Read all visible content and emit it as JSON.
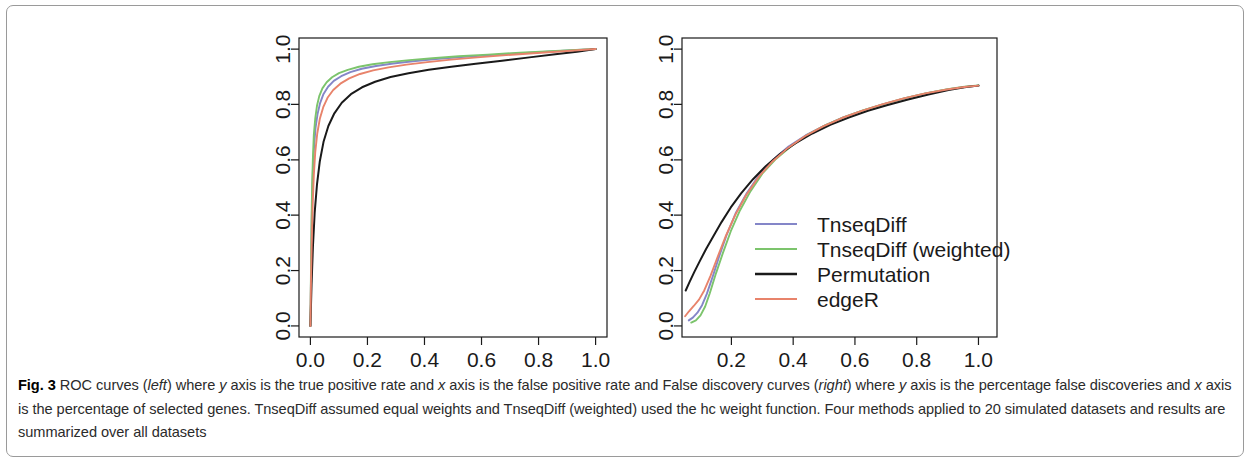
{
  "figure": {
    "label": "Fig. 3",
    "caption_parts": [
      {
        "t": " ROC curves ("
      },
      {
        "t": "left",
        "style": "italic"
      },
      {
        "t": ") where "
      },
      {
        "t": "y",
        "style": "italic"
      },
      {
        "t": " axis is the true positive rate and "
      },
      {
        "t": "x",
        "style": "italic"
      },
      {
        "t": " axis is the false positive rate and False discovery curves ("
      },
      {
        "t": "right",
        "style": "italic"
      },
      {
        "t": ") where "
      },
      {
        "t": "y",
        "style": "italic"
      },
      {
        "t": " axis is the percentage false discoveries and "
      },
      {
        "t": "x",
        "style": "italic"
      },
      {
        "t": " axis is the percentage of selected genes. TnseqDiff assumed equal weights and TnseqDiff (weighted) used the hc weight function. Four methods applied to 20 simulated datasets and results are summarized over all datasets"
      }
    ]
  },
  "colors": {
    "tnseqdiff": "#8486c8",
    "tnseqdiff_weighted": "#7cc46c",
    "permutation": "#1a1a1a",
    "edger": "#e8836b",
    "axis": "#1a1a1a",
    "frame": "#9a9a9a"
  },
  "chart_data": [
    {
      "type": "line",
      "name": "roc-curves",
      "title": "ROC curves",
      "position": "left",
      "xlabel": "false positive rate",
      "ylabel": "true positive rate",
      "xlim": [
        -0.04,
        1.04
      ],
      "ylim": [
        -0.04,
        1.04
      ],
      "xticks": [
        0.0,
        0.2,
        0.4,
        0.6,
        0.8,
        1.0
      ],
      "yticks": [
        0.0,
        0.2,
        0.4,
        0.6,
        0.8,
        1.0
      ],
      "xticklabels": [
        "0.0",
        "0.2",
        "0.4",
        "0.6",
        "0.8",
        "1.0"
      ],
      "yticklabels": [
        "0.0",
        "0.2",
        "0.4",
        "0.6",
        "0.8",
        "1.0"
      ],
      "grid": false,
      "legend": null,
      "series": [
        {
          "name": "TnseqDiff",
          "color": "#8486c8",
          "x": [
            0.0,
            0.002,
            0.004,
            0.006,
            0.009,
            0.013,
            0.018,
            0.025,
            0.034,
            0.046,
            0.062,
            0.082,
            0.108,
            0.14,
            0.18,
            0.23,
            0.29,
            0.36,
            0.44,
            0.53,
            0.63,
            0.74,
            0.86,
            1.0
          ],
          "y": [
            0.0,
            0.17,
            0.33,
            0.46,
            0.57,
            0.65,
            0.715,
            0.765,
            0.805,
            0.838,
            0.864,
            0.885,
            0.902,
            0.917,
            0.929,
            0.939,
            0.948,
            0.956,
            0.964,
            0.971,
            0.978,
            0.985,
            0.992,
            1.0
          ]
        },
        {
          "name": "TnseqDiff (weighted)",
          "color": "#7cc46c",
          "x": [
            0.0,
            0.002,
            0.004,
            0.006,
            0.009,
            0.012,
            0.017,
            0.023,
            0.031,
            0.042,
            0.057,
            0.076,
            0.1,
            0.131,
            0.17,
            0.218,
            0.277,
            0.347,
            0.428,
            0.52,
            0.622,
            0.735,
            0.86,
            1.0
          ],
          "y": [
            0.0,
            0.2,
            0.375,
            0.51,
            0.615,
            0.69,
            0.75,
            0.795,
            0.83,
            0.858,
            0.88,
            0.898,
            0.913,
            0.925,
            0.936,
            0.945,
            0.953,
            0.96,
            0.967,
            0.974,
            0.98,
            0.987,
            0.993,
            1.0
          ]
        },
        {
          "name": "Permutation",
          "color": "#1a1a1a",
          "x": [
            0.0,
            0.004,
            0.009,
            0.015,
            0.023,
            0.033,
            0.046,
            0.063,
            0.084,
            0.11,
            0.142,
            0.181,
            0.227,
            0.281,
            0.344,
            0.415,
            0.494,
            0.58,
            0.672,
            0.768,
            0.866,
            0.935,
            1.0
          ],
          "y": [
            0.0,
            0.15,
            0.29,
            0.41,
            0.51,
            0.595,
            0.665,
            0.722,
            0.768,
            0.806,
            0.837,
            0.862,
            0.882,
            0.899,
            0.913,
            0.925,
            0.936,
            0.947,
            0.958,
            0.97,
            0.982,
            0.99,
            1.0
          ]
        },
        {
          "name": "edgeR",
          "color": "#e8836b",
          "x": [
            0.0,
            0.002,
            0.005,
            0.008,
            0.012,
            0.017,
            0.024,
            0.033,
            0.045,
            0.06,
            0.08,
            0.105,
            0.136,
            0.174,
            0.22,
            0.274,
            0.337,
            0.41,
            0.493,
            0.585,
            0.686,
            0.795,
            0.9,
            1.0
          ],
          "y": [
            0.0,
            0.16,
            0.315,
            0.44,
            0.545,
            0.628,
            0.695,
            0.748,
            0.79,
            0.824,
            0.852,
            0.875,
            0.894,
            0.91,
            0.923,
            0.934,
            0.944,
            0.953,
            0.962,
            0.97,
            0.978,
            0.986,
            0.993,
            1.0
          ]
        }
      ]
    },
    {
      "type": "line",
      "name": "false-discovery-curves",
      "title": "False discovery curves",
      "position": "right",
      "xlabel": "percentage of selected genes",
      "ylabel": "percentage false discoveries",
      "xlim": [
        0.04,
        1.06
      ],
      "ylim": [
        -0.04,
        1.04
      ],
      "xticks": [
        0.2,
        0.4,
        0.6,
        0.8,
        1.0
      ],
      "yticks": [
        0.0,
        0.2,
        0.4,
        0.6,
        0.8,
        1.0
      ],
      "xticklabels": [
        "0.2",
        "0.4",
        "0.6",
        "0.8",
        "1.0"
      ],
      "yticklabels": [
        "0.0",
        "0.2",
        "0.4",
        "0.6",
        "0.8",
        "1.0"
      ],
      "grid": false,
      "legend": {
        "position": "inside-lower-right",
        "entries": [
          {
            "label": "TnseqDiff",
            "color": "#8486c8"
          },
          {
            "label": "TnseqDiff (weighted)",
            "color": "#7cc46c"
          },
          {
            "label": "Permutation",
            "color": "#1a1a1a"
          },
          {
            "label": "edgeR",
            "color": "#e8836b"
          }
        ]
      },
      "series": [
        {
          "name": "TnseqDiff",
          "color": "#8486c8",
          "x": [
            0.062,
            0.075,
            0.09,
            0.105,
            0.12,
            0.14,
            0.16,
            0.185,
            0.215,
            0.25,
            0.29,
            0.335,
            0.385,
            0.44,
            0.5,
            0.56,
            0.625,
            0.69,
            0.76,
            0.83,
            0.9,
            0.955,
            1.0
          ],
          "y": [
            0.02,
            0.03,
            0.048,
            0.075,
            0.115,
            0.18,
            0.25,
            0.33,
            0.41,
            0.48,
            0.545,
            0.6,
            0.648,
            0.688,
            0.723,
            0.752,
            0.778,
            0.8,
            0.822,
            0.84,
            0.854,
            0.863,
            0.868
          ]
        },
        {
          "name": "TnseqDiff (weighted)",
          "color": "#7cc46c",
          "x": [
            0.07,
            0.085,
            0.1,
            0.115,
            0.13,
            0.15,
            0.172,
            0.198,
            0.228,
            0.262,
            0.3,
            0.345,
            0.395,
            0.448,
            0.505,
            0.565,
            0.628,
            0.693,
            0.762,
            0.832,
            0.9,
            0.955,
            1.0
          ],
          "y": [
            0.012,
            0.02,
            0.038,
            0.07,
            0.118,
            0.19,
            0.262,
            0.342,
            0.418,
            0.487,
            0.55,
            0.604,
            0.651,
            0.691,
            0.725,
            0.754,
            0.779,
            0.801,
            0.823,
            0.841,
            0.855,
            0.864,
            0.869
          ]
        },
        {
          "name": "Permutation",
          "color": "#1a1a1a",
          "x": [
            0.052,
            0.065,
            0.08,
            0.098,
            0.118,
            0.142,
            0.168,
            0.198,
            0.232,
            0.27,
            0.312,
            0.358,
            0.408,
            0.462,
            0.52,
            0.58,
            0.642,
            0.706,
            0.772,
            0.838,
            0.903,
            0.955,
            1.0
          ],
          "y": [
            0.128,
            0.16,
            0.195,
            0.235,
            0.278,
            0.325,
            0.375,
            0.428,
            0.48,
            0.53,
            0.578,
            0.622,
            0.66,
            0.695,
            0.726,
            0.753,
            0.777,
            0.798,
            0.818,
            0.836,
            0.852,
            0.862,
            0.868
          ]
        },
        {
          "name": "edgeR",
          "color": "#e8836b",
          "x": [
            0.05,
            0.062,
            0.078,
            0.095,
            0.112,
            0.132,
            0.155,
            0.182,
            0.213,
            0.248,
            0.288,
            0.333,
            0.383,
            0.438,
            0.497,
            0.558,
            0.622,
            0.688,
            0.758,
            0.828,
            0.898,
            0.954,
            1.0
          ],
          "y": [
            0.035,
            0.052,
            0.072,
            0.095,
            0.128,
            0.18,
            0.248,
            0.325,
            0.402,
            0.473,
            0.538,
            0.594,
            0.643,
            0.685,
            0.721,
            0.751,
            0.777,
            0.8,
            0.822,
            0.84,
            0.854,
            0.863,
            0.868
          ]
        }
      ]
    }
  ]
}
